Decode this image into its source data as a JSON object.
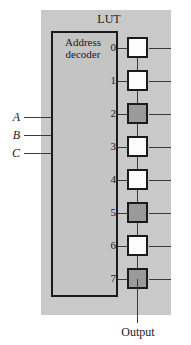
{
  "diagram": {
    "title": "LUT",
    "decoder": {
      "label_line1": "Address",
      "label_line2": "decoder"
    },
    "inputs": [
      {
        "label": "A"
      },
      {
        "label": "B"
      },
      {
        "label": "C"
      }
    ],
    "rows": [
      {
        "index": "0",
        "bit": 0
      },
      {
        "index": "1",
        "bit": 0
      },
      {
        "index": "2",
        "bit": 1
      },
      {
        "index": "3",
        "bit": 0
      },
      {
        "index": "4",
        "bit": 0
      },
      {
        "index": "5",
        "bit": 1
      },
      {
        "index": "6",
        "bit": 0
      },
      {
        "index": "7",
        "bit": 1
      }
    ],
    "output": {
      "label": "Output"
    },
    "colors": {
      "panel_background": "#c9c9c9",
      "decoder_fill": "#c4c4c4",
      "cell_bit0_fill": "#fcfcfc",
      "cell_bit1_fill": "#9a9a9a",
      "outline": "#1a1a1a",
      "wire": "#3a3a3a"
    }
  }
}
